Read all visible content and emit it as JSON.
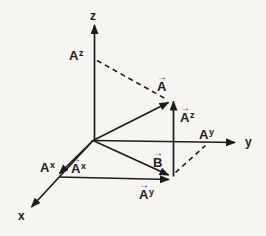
{
  "diagram": {
    "background": "#f6f5f1",
    "ink": "#1c1c1c",
    "axes": {
      "z": "z",
      "y": "y",
      "x": "x"
    },
    "intercept_labels": {
      "az": {
        "base": "A",
        "sup": "z"
      },
      "ay": {
        "base": "A",
        "sup": "y"
      },
      "ax": {
        "base": "A",
        "sup": "x"
      }
    },
    "vector_labels": {
      "a": {
        "arrow": "→",
        "base": "A",
        "sup": ""
      },
      "b": {
        "arrow": "→",
        "base": "B",
        "sup": ""
      },
      "az": {
        "arrow": "→",
        "base": "A",
        "sup": "z"
      },
      "ay": {
        "arrow": "→",
        "base": "A",
        "sup": "y"
      },
      "ax": {
        "arrow": "→",
        "base": "A",
        "sup": "x"
      }
    }
  }
}
